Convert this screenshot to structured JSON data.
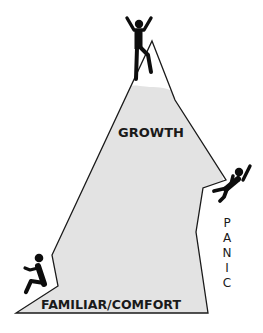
{
  "diagram": {
    "zones": {
      "growth": "GROWTH",
      "comfort": "FAMILIAR/COMFORT",
      "panic_letters": [
        "P",
        "A",
        "N",
        "I",
        "C"
      ]
    },
    "figures": [
      {
        "name": "climber-summit",
        "pose": "arms raised"
      },
      {
        "name": "climber-falling",
        "pose": "falling"
      },
      {
        "name": "climber-seated",
        "pose": "seated"
      }
    ],
    "colors": {
      "fill": "#e3e3e3",
      "stroke": "#1a1a1a",
      "figure": "#0d0d0d"
    }
  }
}
